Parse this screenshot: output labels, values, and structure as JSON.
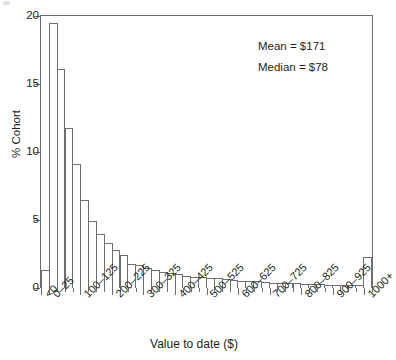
{
  "figure": {
    "corner_mark": "partial-glyph-artifact"
  },
  "annotations": {
    "mean": "Mean = $171",
    "median": "Median = $78"
  },
  "axes": {
    "y_label": "% Cohort",
    "x_label": "Value to date ($)",
    "y_ticks": [
      "0",
      "5",
      "10",
      "15",
      "20"
    ],
    "x_tick_labels": [
      "<0",
      "0–25",
      "100–125",
      "200–225",
      "300–325",
      "400–425",
      "500–525",
      "600–625",
      "700–725",
      "800–825",
      "900–925",
      "1000+"
    ]
  },
  "colors": {
    "bar_stroke": "#6d6e71",
    "bar_fill": "#ffffff",
    "axis": "#58595b",
    "text": "#231f20",
    "background": "#ffffff"
  },
  "chart_data": {
    "type": "bar",
    "title": "",
    "subtitle": "",
    "xlabel": "Value to date ($)",
    "ylabel": "% Cohort",
    "ylim": [
      0,
      20
    ],
    "yticks": [
      0,
      5,
      10,
      15,
      20
    ],
    "grid": false,
    "legend": "none",
    "annotations": [
      "Mean = $171",
      "Median = $78"
    ],
    "categories": [
      "<0",
      "0–25",
      "25–50",
      "50–75",
      "75–100",
      "100–125",
      "125–150",
      "150–175",
      "175–200",
      "200–225",
      "225–250",
      "250–275",
      "275–300",
      "300–325",
      "325–350",
      "350–375",
      "375–400",
      "400–425",
      "425–450",
      "450–475",
      "475–500",
      "500–525",
      "525–550",
      "550–575",
      "575–600",
      "600–625",
      "625–650",
      "650–675",
      "675–700",
      "700–725",
      "725–750",
      "750–775",
      "775–800",
      "800–825",
      "825–850",
      "850–875",
      "875–900",
      "900–925",
      "925–950",
      "950–975",
      "975–1000",
      "1000+"
    ],
    "values": [
      1.3,
      19.5,
      16.1,
      11.8,
      9.1,
      6.5,
      4.9,
      4.0,
      3.3,
      2.8,
      2.4,
      1.8,
      1.7,
      1.5,
      1.35,
      1.2,
      1.1,
      1.0,
      0.85,
      0.8,
      0.8,
      0.75,
      0.7,
      0.65,
      0.6,
      0.55,
      0.5,
      0.5,
      0.45,
      0.4,
      0.4,
      0.35,
      0.35,
      0.3,
      0.3,
      0.3,
      0.25,
      0.25,
      0.2,
      0.2,
      0.2,
      2.3
    ],
    "labeled_tick_indices": [
      0,
      1,
      5,
      9,
      13,
      17,
      21,
      25,
      29,
      33,
      37,
      41
    ]
  }
}
